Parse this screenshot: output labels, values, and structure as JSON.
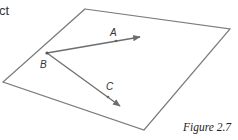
{
  "partial_text": "ct",
  "caption": "Figure 2.7",
  "diagram": {
    "plane": {
      "corners": [
        [
          85,
          9
        ],
        [
          230,
          29
        ],
        [
          144,
          130
        ],
        [
          3,
          82
        ]
      ],
      "stroke": "#7a7a7a"
    },
    "vertex": {
      "label": "B",
      "position": [
        47,
        53
      ]
    },
    "rays": [
      {
        "name": "ray-BA",
        "from": [
          47,
          53
        ],
        "to": [
          141,
          37
        ],
        "point_label": "A",
        "point": [
          116,
          41
        ]
      },
      {
        "name": "ray-BC",
        "from": [
          47,
          53
        ],
        "to": [
          121,
          107
        ],
        "point_label": "C",
        "point": [
          108,
          97
        ]
      }
    ],
    "labels": {
      "A": "A",
      "B": "B",
      "C": "C"
    }
  }
}
